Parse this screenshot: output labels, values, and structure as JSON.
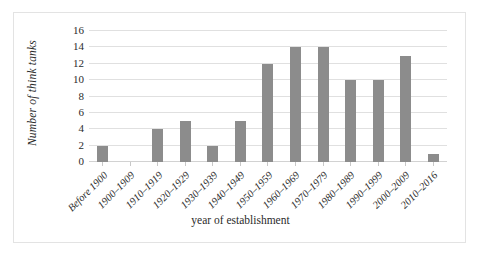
{
  "chart_data": {
    "type": "bar",
    "title": "",
    "xlabel": "year of establishment",
    "ylabel": "Number of think tanks",
    "categories": [
      "Before 1900",
      "1900–1909",
      "1910–1919",
      "1920–1929",
      "1930–1939",
      "1940–1949",
      "1950–1959",
      "1960–1969",
      "1970–1979",
      "1980–1989",
      "1990–1999",
      "2000–2009",
      "2010–2016"
    ],
    "values": [
      2,
      0,
      4,
      5,
      2,
      5,
      12,
      14,
      14,
      10,
      10,
      13,
      1
    ],
    "ylim": [
      0,
      16
    ],
    "ytick_step": 2,
    "yticks": [
      "0",
      "2",
      "4",
      "6",
      "8",
      "10",
      "12",
      "14",
      "16"
    ],
    "grid": true,
    "legend": false,
    "bar_color": "#8c8c8c",
    "gridline_color": "#e0e0e0",
    "border_color": "#e3e3e3",
    "text_color": "#2b2b2b"
  }
}
